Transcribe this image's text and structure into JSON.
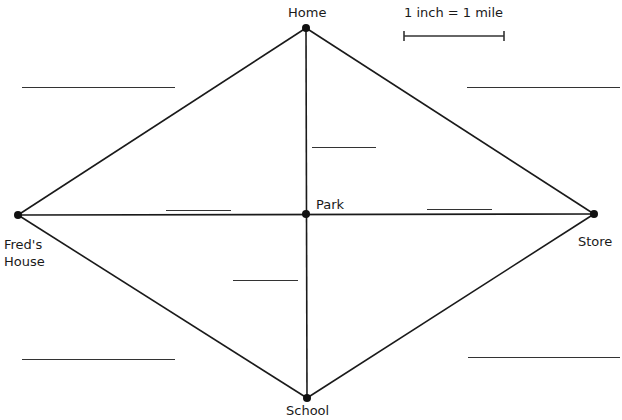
{
  "map": {
    "scale": {
      "label": "1 inch = 1 mile",
      "bar": {
        "x1": 404,
        "x2": 504,
        "y": 36
      }
    },
    "nodes": [
      {
        "id": "home",
        "label": "Home",
        "x": 306,
        "y": 28
      },
      {
        "id": "freds-house",
        "label": "Fred's House",
        "line1": "Fred's",
        "line2": "House",
        "x": 18,
        "y": 215
      },
      {
        "id": "park",
        "label": "Park",
        "x": 306,
        "y": 214
      },
      {
        "id": "store",
        "label": "Store",
        "x": 594,
        "y": 214
      },
      {
        "id": "school",
        "label": "School",
        "x": 307,
        "y": 398
      }
    ],
    "edges": [
      {
        "from": "home",
        "to": "freds-house"
      },
      {
        "from": "home",
        "to": "store"
      },
      {
        "from": "home",
        "to": "school"
      },
      {
        "from": "freds-house",
        "to": "store"
      },
      {
        "from": "freds-house",
        "to": "school"
      },
      {
        "from": "store",
        "to": "school"
      }
    ],
    "answer_blanks": [
      {
        "id": "home-freds",
        "x1": 22,
        "x2": 175,
        "y": 87,
        "value": ""
      },
      {
        "id": "home-store",
        "x1": 467,
        "x2": 620,
        "y": 87,
        "value": ""
      },
      {
        "id": "home-park",
        "x1": 312,
        "x2": 376,
        "y": 147,
        "value": ""
      },
      {
        "id": "freds-park",
        "x1": 166,
        "x2": 231,
        "y": 210,
        "value": ""
      },
      {
        "id": "park-store",
        "x1": 427,
        "x2": 492,
        "y": 209,
        "value": ""
      },
      {
        "id": "park-school",
        "x1": 233,
        "x2": 298,
        "y": 280,
        "value": ""
      },
      {
        "id": "freds-school",
        "x1": 22,
        "x2": 175,
        "y": 359,
        "value": ""
      },
      {
        "id": "store-school",
        "x1": 468,
        "x2": 620,
        "y": 357,
        "value": ""
      }
    ],
    "colors": {
      "line": "#1a1a1a",
      "node": "#111111",
      "blank": "#333333",
      "background": "#ffffff"
    }
  }
}
